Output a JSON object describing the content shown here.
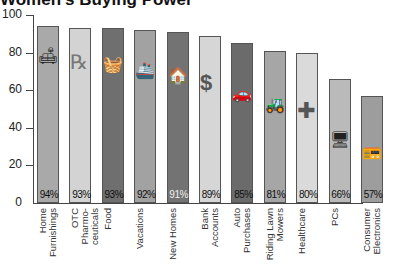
{
  "chart_data": {
    "type": "bar",
    "title": "Women's Buying Power",
    "xlabel": "",
    "ylabel": "",
    "ylim": [
      0,
      100
    ],
    "yticks": [
      0,
      20,
      40,
      60,
      80,
      100
    ],
    "categories": [
      "Home Furnishings",
      "OTC Pharmaceuticals",
      "Food",
      "Vacations",
      "New Homes",
      "Bank Accounts",
      "Auto Purchases",
      "Riding Lawn Mowers",
      "Healthcare",
      "PCs",
      "Consumer Electronics"
    ],
    "values": [
      94,
      93,
      93,
      92,
      91,
      89,
      85,
      81,
      80,
      66,
      57
    ],
    "value_labels": [
      "94%",
      "93%",
      "93%",
      "92%",
      "91%",
      "89%",
      "85%",
      "81%",
      "80%",
      "66%",
      "57%"
    ],
    "grid": false,
    "legend": null
  },
  "title": "Women's Buying Power",
  "y_ticks": [
    "0",
    "20",
    "40",
    "60",
    "80",
    "100"
  ],
  "bars": [
    {
      "l1": "Home",
      "l2": "Furnishings",
      "pct": "94%",
      "value": 94,
      "color": "#a9a9a9",
      "pctColor": "#111",
      "icon": "armchair-lamp-icon",
      "glyph": "🛋"
    },
    {
      "l1": "OTC Pharmo-",
      "l2": "ceuticals",
      "pct": "93%",
      "value": 93,
      "color": "#d3d3d3",
      "pctColor": "#111",
      "icon": "pills-rx-icon",
      "glyph": "℞"
    },
    {
      "l1": "Food",
      "l2": "",
      "pct": "93%",
      "value": 93,
      "color": "#6f6f6f",
      "pctColor": "#111",
      "icon": "food-basket-icon",
      "glyph": "🧺"
    },
    {
      "l1": "Vacations",
      "l2": "",
      "pct": "92%",
      "value": 92,
      "color": "#a2a2a2",
      "pctColor": "#111",
      "icon": "cruise-ship-icon",
      "glyph": "🚢"
    },
    {
      "l1": "New Homes",
      "l2": "",
      "pct": "91%",
      "value": 91,
      "color": "#737373",
      "pctColor": "#f0f0f0",
      "icon": "house-icon",
      "glyph": "🏠"
    },
    {
      "l1": "Bank",
      "l2": "Accounts",
      "pct": "89%",
      "value": 89,
      "color": "#d6d6d6",
      "pctColor": "#111",
      "icon": "dollar-sign-icon",
      "glyph": "$"
    },
    {
      "l1": "Auto",
      "l2": "Purchases",
      "pct": "85%",
      "value": 85,
      "color": "#6b6b6b",
      "pctColor": "#111",
      "icon": "car-icon",
      "glyph": "🚗"
    },
    {
      "l1": "Riding Lawn",
      "l2": "Mowers",
      "pct": "81%",
      "value": 81,
      "color": "#a6a6a6",
      "pctColor": "#111",
      "icon": "lawn-mower-icon",
      "glyph": "🚜"
    },
    {
      "l1": "Healthcare",
      "l2": "",
      "pct": "80%",
      "value": 80,
      "color": "#dadada",
      "pctColor": "#111",
      "icon": "medical-cross-icon",
      "glyph": "✚"
    },
    {
      "l1": "PCs",
      "l2": "",
      "pct": "66%",
      "value": 66,
      "color": "#bababa",
      "pctColor": "#111",
      "icon": "computer-icon",
      "glyph": "🖥"
    },
    {
      "l1": "Consumer",
      "l2": "Electronics",
      "pct": "57%",
      "value": 57,
      "color": "#9d9d9d",
      "pctColor": "#111",
      "icon": "boombox-icon",
      "glyph": "📻"
    }
  ]
}
